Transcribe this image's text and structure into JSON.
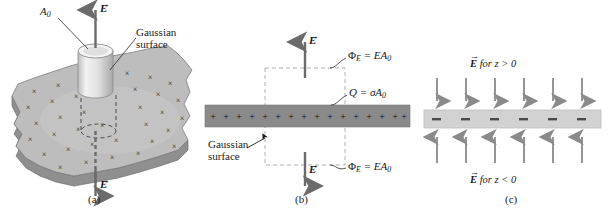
{
  "figure": {
    "colors": {
      "sheet_top": "#b9b9b9",
      "sheet_edge": "#8f8f8f",
      "cylinder": "#e6e6e6",
      "slab_positive": "#8a8a8a",
      "slab_negative": "#d2d2d2",
      "arrow": "#6b6b6b",
      "dashed": "#b0b0b0",
      "ink": "#1a1a1a"
    }
  },
  "panels": [
    {
      "id": "a",
      "caption": "(a)",
      "labels": {
        "area": "A",
        "area_sub": "0",
        "gaussian_line1": "Gaussian",
        "gaussian_line2": "surface",
        "field_top": "E",
        "field_bottom": "E"
      },
      "charge_marks": {
        "glyph": "×",
        "count": 34,
        "meaning": "positive-charge-marks-on-sheet"
      },
      "description": "Perspective view of a charged sheet pierced by a cylindrical Gaussian surface; field arrows point up and down."
    },
    {
      "id": "b",
      "caption": "(b)",
      "labels": {
        "flux_top": "Φ",
        "flux_top_sub": "E",
        "flux_top_rhs": " = EA",
        "flux_top_rhs_sub": "0",
        "flux_bottom": "Φ",
        "flux_bottom_sub": "E",
        "flux_bottom_rhs": " = EA",
        "flux_bottom_rhs_sub": "0",
        "charge": "Q",
        "charge_rhs": " = σA",
        "charge_rhs_sub": "0",
        "gaussian_line1": "Gaussian",
        "gaussian_line2": "surface",
        "field_top": "E",
        "field_bottom": "E"
      },
      "charge_marks": {
        "glyph": "+",
        "count": 16,
        "meaning": "positive-surface-charge"
      },
      "description": "Edge-on cross section of a positively charged sheet with a dashed rectangular Gaussian surface; flux EA0 exits top and bottom."
    },
    {
      "id": "c",
      "caption": "(c)",
      "labels": {
        "field_above": "E",
        "field_above_rest": " for z > 0",
        "field_below": "E",
        "field_below_rest": " for z < 0"
      },
      "charge_marks": {
        "glyph": "–",
        "count": 6,
        "meaning": "negative-surface-charge"
      },
      "arrows": {
        "above_count": 6,
        "above_direction": "down",
        "below_count": 6,
        "below_direction": "up"
      },
      "description": "Negatively charged sheet; field points toward the sheet from both sides."
    }
  ]
}
